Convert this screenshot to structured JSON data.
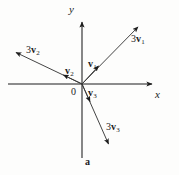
{
  "figure": {
    "panel_label": "a",
    "background_color": "#fdfdfc",
    "stroke_color": "#1c1c1c",
    "width": 179,
    "height": 175,
    "axes": {
      "x_label": "x",
      "y_label": "y",
      "origin_label": "0",
      "origin": [
        82,
        84
      ],
      "x_axis": {
        "from": [
          8,
          84
        ],
        "to": [
          156,
          84
        ]
      },
      "y_axis": {
        "from": [
          82,
          158
        ],
        "to": [
          82,
          18
        ]
      }
    },
    "vectors": [
      {
        "name": "v1",
        "label_coefficient": "",
        "label_symbol": "v",
        "label_subscript": "1",
        "label_text": "v₁",
        "from": [
          82,
          84
        ],
        "to": [
          102,
          62
        ],
        "label_pos": [
          88,
          59
        ]
      },
      {
        "name": "3v1",
        "label_coefficient": "3",
        "label_symbol": "v",
        "label_subscript": "1",
        "label_text": "3v₁",
        "from": [
          82,
          84
        ],
        "to": [
          142,
          23
        ],
        "label_pos": [
          131,
          34
        ]
      },
      {
        "name": "v2",
        "label_coefficient": "",
        "label_symbol": "v",
        "label_subscript": "2",
        "label_text": "v₂",
        "from": [
          82,
          84
        ],
        "to": [
          59,
          73
        ],
        "label_pos": [
          65,
          66
        ]
      },
      {
        "name": "3v2",
        "label_coefficient": "3",
        "label_symbol": "v",
        "label_subscript": "2",
        "label_text": "3v₂",
        "from": [
          82,
          84
        ],
        "to": [
          11,
          50
        ],
        "label_pos": [
          26,
          45
        ]
      },
      {
        "name": "v3",
        "label_coefficient": "",
        "label_symbol": "v",
        "label_subscript": "3",
        "label_text": "v₃",
        "from": [
          82,
          84
        ],
        "to": [
          92,
          106
        ],
        "label_pos": [
          88,
          88
        ]
      },
      {
        "name": "3v3",
        "label_coefficient": "3",
        "label_symbol": "v",
        "label_subscript": "3",
        "label_text": "3v₃",
        "from": [
          82,
          84
        ],
        "to": [
          111,
          149
        ],
        "label_pos": [
          106,
          122
        ]
      }
    ]
  }
}
